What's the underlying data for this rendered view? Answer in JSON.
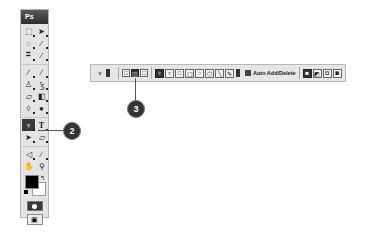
{
  "toolbox": {
    "title": "Ps",
    "tools": [
      {
        "name": "marquee",
        "glyph": "⬚"
      },
      {
        "name": "move",
        "glyph": "➤"
      },
      {
        "name": "lasso",
        "glyph": "◌"
      },
      {
        "name": "magic-wand",
        "glyph": "⁄"
      },
      {
        "name": "crop",
        "glyph": "⌗"
      },
      {
        "name": "slice",
        "glyph": "⁄"
      },
      {
        "name": "healing-brush",
        "glyph": "∕"
      },
      {
        "name": "brush",
        "glyph": "∕"
      },
      {
        "name": "clone-stamp",
        "glyph": "♙"
      },
      {
        "name": "history-brush",
        "glyph": "Ꝣ"
      },
      {
        "name": "eraser",
        "glyph": "▱"
      },
      {
        "name": "gradient",
        "glyph": "◧"
      },
      {
        "name": "blur",
        "glyph": "◊"
      },
      {
        "name": "dodge",
        "glyph": "●"
      },
      {
        "name": "pen",
        "glyph": "♆",
        "active": true
      },
      {
        "name": "type",
        "glyph": "T"
      },
      {
        "name": "path-selection",
        "glyph": "➤"
      },
      {
        "name": "custom-shape",
        "glyph": "▱"
      },
      {
        "name": "notes",
        "glyph": "◁"
      },
      {
        "name": "eyedropper",
        "glyph": "∕"
      },
      {
        "name": "hand",
        "glyph": "✋"
      },
      {
        "name": "zoom",
        "glyph": "⚲"
      }
    ],
    "swap_glyph": "↰",
    "screen_mode_glyph": "▣"
  },
  "options_bar": {
    "preset_glyph": "♆",
    "path_modes": [
      {
        "name": "shape-layers",
        "glyph": "□"
      },
      {
        "name": "paths",
        "glyph": "◫",
        "active": true
      },
      {
        "name": "fill-pixels",
        "glyph": "□"
      }
    ],
    "shape_tools": [
      {
        "name": "pen",
        "glyph": "♆",
        "active": true
      },
      {
        "name": "freeform-pen",
        "glyph": "♆"
      },
      {
        "name": "rectangle",
        "glyph": "□"
      },
      {
        "name": "rounded-rectangle",
        "glyph": "▢"
      },
      {
        "name": "ellipse",
        "glyph": "○"
      },
      {
        "name": "polygon",
        "glyph": "⬡"
      },
      {
        "name": "line",
        "glyph": "╲"
      },
      {
        "name": "custom-shape",
        "glyph": "✎"
      }
    ],
    "auto_add_delete": {
      "label": "Auto Add/Delete",
      "checked": true
    },
    "combine_modes": [
      {
        "name": "add",
        "glyph": "■"
      },
      {
        "name": "subtract",
        "glyph": "◩"
      },
      {
        "name": "intersect",
        "glyph": "◘"
      },
      {
        "name": "exclude",
        "glyph": "◙"
      }
    ]
  },
  "callouts": [
    {
      "number": "2"
    },
    {
      "number": "3"
    }
  ]
}
